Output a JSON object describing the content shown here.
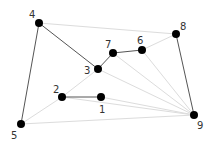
{
  "diagram": {
    "type": "graph",
    "nodes": [
      {
        "id": "1",
        "label": "1",
        "x": 101,
        "y": 97,
        "lx": 99,
        "ly": 113
      },
      {
        "id": "2",
        "label": "2",
        "x": 62,
        "y": 97,
        "lx": 53,
        "ly": 93
      },
      {
        "id": "3",
        "label": "3",
        "x": 98,
        "y": 69,
        "lx": 84,
        "ly": 74
      },
      {
        "id": "4",
        "label": "4",
        "x": 39,
        "y": 23,
        "lx": 29,
        "ly": 18
      },
      {
        "id": "5",
        "label": "5",
        "x": 21,
        "y": 124,
        "lx": 11,
        "ly": 139
      },
      {
        "id": "6",
        "label": "6",
        "x": 142,
        "y": 50,
        "lx": 137,
        "ly": 44
      },
      {
        "id": "7",
        "label": "7",
        "x": 113,
        "y": 53,
        "lx": 105,
        "ly": 48
      },
      {
        "id": "8",
        "label": "8",
        "x": 176,
        "y": 34,
        "lx": 180,
        "ly": 30
      },
      {
        "id": "9",
        "label": "9",
        "x": 194,
        "y": 115,
        "lx": 197,
        "ly": 129
      }
    ],
    "edges_dark": [
      [
        "4",
        "3"
      ],
      [
        "3",
        "7"
      ],
      [
        "7",
        "6"
      ],
      [
        "2",
        "1"
      ],
      [
        "4",
        "5"
      ],
      [
        "8",
        "9"
      ]
    ],
    "edges_light": [
      [
        "4",
        "8"
      ],
      [
        "6",
        "8"
      ],
      [
        "5",
        "9"
      ],
      [
        "5",
        "2"
      ],
      [
        "2",
        "3"
      ],
      [
        "3",
        "9"
      ],
      [
        "7",
        "9"
      ],
      [
        "6",
        "9"
      ],
      [
        "1",
        "9"
      ],
      [
        "2",
        "9"
      ]
    ],
    "colors": {
      "node": "#000000",
      "dark_edge": "#555555",
      "light_edge": "#dcdcdc",
      "label": "#333333"
    }
  }
}
